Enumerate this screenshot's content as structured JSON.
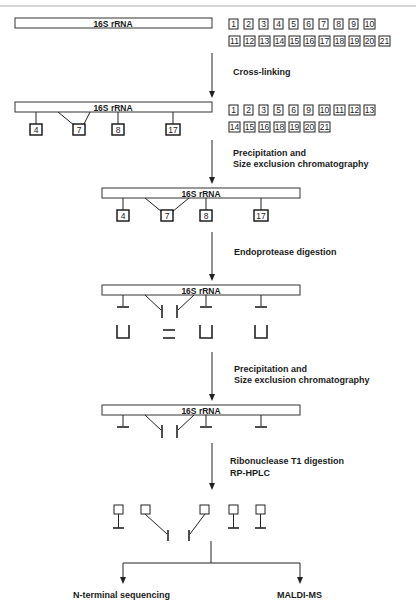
{
  "rrna_label": "16S rRNA",
  "steps": [
    {
      "line1": "Cross-linking",
      "line2": ""
    },
    {
      "line1": "Precipitation and",
      "line2": "Size exclusion chromatography"
    },
    {
      "line1": "Endoprotease digestion",
      "line2": ""
    },
    {
      "line1": "Precipitation and",
      "line2": "Size exclusion chromatography"
    },
    {
      "line1": "Ribonuclease T1 digestion",
      "line2": "RP-HPLC"
    }
  ],
  "outputs": {
    "left": "N-terminal sequencing",
    "right": "MALDI-MS"
  },
  "free_proteins_initial": {
    "row1": [
      "1",
      "2",
      "3",
      "4",
      "5",
      "6",
      "7",
      "8",
      "9",
      "10"
    ],
    "row2": [
      "11",
      "12",
      "13",
      "14",
      "15",
      "16",
      "17",
      "18",
      "19",
      "20",
      "21"
    ]
  },
  "free_proteins_after_crosslink": {
    "row1": [
      "1",
      "2",
      "3",
      "5",
      "6",
      "9",
      "10",
      "11",
      "12",
      "13"
    ],
    "row2": [
      "14",
      "15",
      "16",
      "18",
      "19",
      "20",
      "21"
    ]
  },
  "crosslinked_proteins": [
    "4",
    "7",
    "8",
    "17"
  ],
  "colors": {
    "line": "#222222",
    "background": "#ffffff"
  }
}
